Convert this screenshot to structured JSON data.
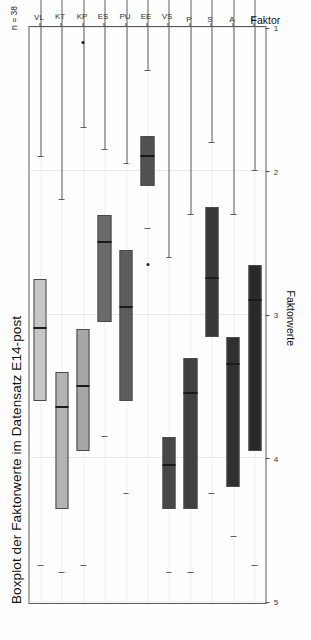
{
  "title": "Boxplot der Faktorwerte im Datensatz E14-post",
  "annotation": "n = 38",
  "axes": {
    "value_axis_label": "Faktorwerte",
    "category_axis_label": "Faktor"
  },
  "chart_data": {
    "type": "boxplot",
    "title": "Boxplot der Faktorwerte im Datensatz E14-post",
    "orientation": "horizontal",
    "xlabel": "Faktor",
    "ylabel": "Faktorwerte",
    "ylim": [
      5,
      1
    ],
    "yticks": [
      5,
      4,
      3,
      2,
      1
    ],
    "ytick_labels": [
      "5",
      "4",
      "3",
      "2",
      "1"
    ],
    "grid": true,
    "legend": false,
    "n": 38,
    "categories": [
      "F",
      "A",
      "S",
      "P",
      "VS",
      "EE",
      "PU",
      "ES",
      "KP",
      "KT",
      "VL"
    ],
    "boxes": [
      {
        "label": "F",
        "whisker_low": 2.0,
        "q1": 2.65,
        "median": 2.9,
        "q3": 3.95,
        "whisker_high": 4.75,
        "outliers": [],
        "fill": "#2a2a2a"
      },
      {
        "label": "A",
        "whisker_low": 2.3,
        "q1": 3.15,
        "median": 3.35,
        "q3": 4.2,
        "whisker_high": 4.55,
        "outliers": [],
        "fill": "#303030"
      },
      {
        "label": "S",
        "whisker_low": 1.8,
        "q1": 2.25,
        "median": 2.75,
        "q3": 3.15,
        "whisker_high": 4.25,
        "outliers": [],
        "fill": "#383838"
      },
      {
        "label": "P",
        "whisker_low": 2.3,
        "q1": 3.3,
        "median": 3.55,
        "q3": 4.35,
        "whisker_high": 4.8,
        "outliers": [],
        "fill": "#404040"
      },
      {
        "label": "VS",
        "whisker_low": 2.6,
        "q1": 3.85,
        "median": 4.05,
        "q3": 4.35,
        "whisker_high": 4.8,
        "outliers": [],
        "fill": "#474747"
      },
      {
        "label": "EE",
        "whisker_low": 1.3,
        "q1": 1.75,
        "median": 1.9,
        "q3": 2.1,
        "whisker_high": 2.4,
        "outliers": [
          2.65
        ],
        "fill": "#515151"
      },
      {
        "label": "PU",
        "whisker_low": 1.95,
        "q1": 2.55,
        "median": 2.95,
        "q3": 3.6,
        "whisker_high": 4.25,
        "outliers": [],
        "fill": "#5c5c5c"
      },
      {
        "label": "ES",
        "whisker_low": 1.85,
        "q1": 2.3,
        "median": 2.5,
        "q3": 3.05,
        "whisker_high": 3.85,
        "outliers": [],
        "fill": "#6a6a6a"
      },
      {
        "label": "KP",
        "whisker_low": 1.7,
        "q1": 3.1,
        "median": 3.5,
        "q3": 3.95,
        "whisker_high": 4.75,
        "outliers": [
          1.1
        ],
        "fill": "#a6a6a6"
      },
      {
        "label": "KT",
        "whisker_low": 2.2,
        "q1": 3.4,
        "median": 3.65,
        "q3": 4.35,
        "whisker_high": 4.8,
        "outliers": [],
        "fill": "#b4b4b4"
      },
      {
        "label": "VL",
        "whisker_low": 1.9,
        "q1": 2.75,
        "median": 3.1,
        "q3": 3.6,
        "whisker_high": 4.75,
        "outliers": [],
        "fill": "#c6c6c6"
      }
    ]
  }
}
